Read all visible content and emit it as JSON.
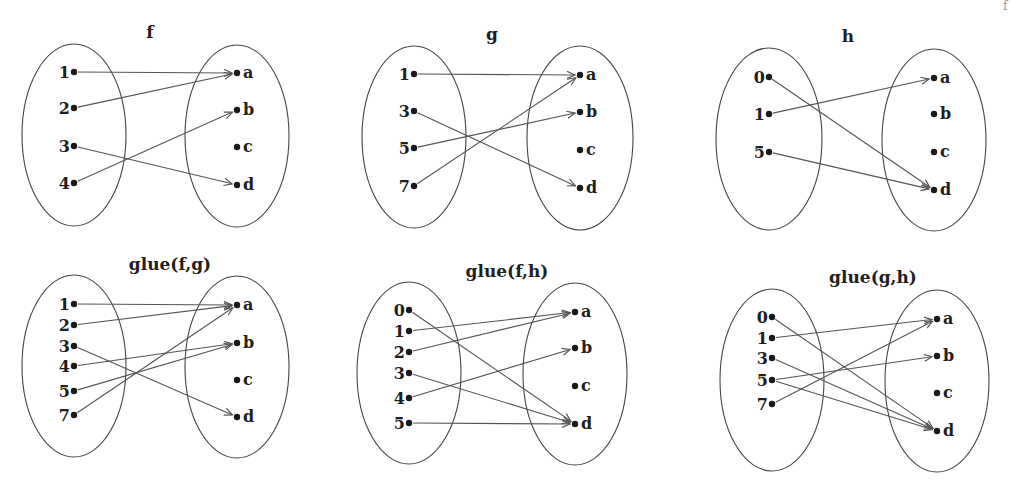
{
  "colors": {
    "ellipse": "#444444",
    "edge": "#555555",
    "dot": "#1a1a1a",
    "text": "#1e1e1e"
  },
  "corner_fragment": "f",
  "panels": [
    {
      "id": "f",
      "title": "f",
      "title_pos": [
        150,
        38
      ],
      "left": {
        "cx": 74,
        "cy": 135,
        "rx": 52,
        "ry": 91,
        "nodes": [
          {
            "label": "1",
            "y": 72
          },
          {
            "label": "2",
            "y": 108
          },
          {
            "label": "3",
            "y": 146
          },
          {
            "label": "4",
            "y": 183
          }
        ]
      },
      "right": {
        "cx": 237,
        "cy": 136,
        "rx": 52,
        "ry": 91,
        "nodes": [
          {
            "label": "a",
            "y": 73
          },
          {
            "label": "b",
            "y": 110
          },
          {
            "label": "c",
            "y": 147
          },
          {
            "label": "d",
            "y": 185
          }
        ]
      },
      "edges": [
        [
          "1",
          "a"
        ],
        [
          "2",
          "a"
        ],
        [
          "3",
          "d"
        ],
        [
          "4",
          "b"
        ]
      ]
    },
    {
      "id": "g",
      "title": "g",
      "title_pos": [
        492,
        40
      ],
      "left": {
        "cx": 414,
        "cy": 137,
        "rx": 52,
        "ry": 91,
        "nodes": [
          {
            "label": "1",
            "y": 74
          },
          {
            "label": "3",
            "y": 111
          },
          {
            "label": "5",
            "y": 148
          },
          {
            "label": "7",
            "y": 186
          }
        ]
      },
      "right": {
        "cx": 580,
        "cy": 138,
        "rx": 53,
        "ry": 92,
        "nodes": [
          {
            "label": "a",
            "y": 75
          },
          {
            "label": "b",
            "y": 112
          },
          {
            "label": "c",
            "y": 150
          },
          {
            "label": "d",
            "y": 188
          }
        ]
      },
      "edges": [
        [
          "1",
          "a"
        ],
        [
          "3",
          "d"
        ],
        [
          "5",
          "b"
        ],
        [
          "7",
          "a"
        ]
      ]
    },
    {
      "id": "h",
      "title": "h",
      "title_pos": [
        848,
        42
      ],
      "left": {
        "cx": 769,
        "cy": 139,
        "rx": 53,
        "ry": 91,
        "nodes": [
          {
            "label": "0",
            "y": 77
          },
          {
            "label": "1",
            "y": 114
          },
          {
            "label": "5",
            "y": 152
          }
        ]
      },
      "right": {
        "cx": 934,
        "cy": 140,
        "rx": 52,
        "ry": 91,
        "nodes": [
          {
            "label": "a",
            "y": 78
          },
          {
            "label": "b",
            "y": 114
          },
          {
            "label": "c",
            "y": 152
          },
          {
            "label": "d",
            "y": 190
          }
        ]
      },
      "edges": [
        [
          "0",
          "d"
        ],
        [
          "1",
          "a"
        ],
        [
          "5",
          "d"
        ]
      ]
    },
    {
      "id": "glue-f-g",
      "title": "glue(f,g)",
      "title_pos": [
        170,
        270
      ],
      "left": {
        "cx": 74,
        "cy": 366,
        "rx": 52,
        "ry": 91,
        "nodes": [
          {
            "label": "1",
            "y": 304
          },
          {
            "label": "2",
            "y": 325
          },
          {
            "label": "3",
            "y": 346
          },
          {
            "label": "4",
            "y": 366
          },
          {
            "label": "5",
            "y": 391
          },
          {
            "label": "7",
            "y": 415
          }
        ]
      },
      "right": {
        "cx": 237,
        "cy": 367,
        "rx": 52,
        "ry": 91,
        "nodes": [
          {
            "label": "a",
            "y": 305
          },
          {
            "label": "b",
            "y": 343
          },
          {
            "label": "c",
            "y": 380
          },
          {
            "label": "d",
            "y": 417
          }
        ]
      },
      "edges": [
        [
          "1",
          "a"
        ],
        [
          "2",
          "a"
        ],
        [
          "3",
          "d"
        ],
        [
          "4",
          "b"
        ],
        [
          "5",
          "b"
        ],
        [
          "7",
          "a"
        ]
      ]
    },
    {
      "id": "glue-f-h",
      "title": "glue(f,h)",
      "title_pos": [
        507,
        277
      ],
      "left": {
        "cx": 409,
        "cy": 373,
        "rx": 52,
        "ry": 91,
        "nodes": [
          {
            "label": "0",
            "y": 310
          },
          {
            "label": "1",
            "y": 331
          },
          {
            "label": "2",
            "y": 352
          },
          {
            "label": "3",
            "y": 373
          },
          {
            "label": "4",
            "y": 398
          },
          {
            "label": "5",
            "y": 423
          }
        ]
      },
      "right": {
        "cx": 575,
        "cy": 374,
        "rx": 52,
        "ry": 91,
        "nodes": [
          {
            "label": "a",
            "y": 312
          },
          {
            "label": "b",
            "y": 348
          },
          {
            "label": "c",
            "y": 386
          },
          {
            "label": "d",
            "y": 424
          }
        ]
      },
      "edges": [
        [
          "0",
          "d"
        ],
        [
          "1",
          "a"
        ],
        [
          "2",
          "a"
        ],
        [
          "3",
          "d"
        ],
        [
          "4",
          "b"
        ],
        [
          "5",
          "d"
        ]
      ]
    },
    {
      "id": "glue-g-h",
      "title": "glue(g,h)",
      "title_pos": [
        873,
        283
      ],
      "left": {
        "cx": 772,
        "cy": 380,
        "rx": 52,
        "ry": 91,
        "nodes": [
          {
            "label": "0",
            "y": 317
          },
          {
            "label": "1",
            "y": 338
          },
          {
            "label": "3",
            "y": 358
          },
          {
            "label": "5",
            "y": 380
          },
          {
            "label": "7",
            "y": 404
          }
        ]
      },
      "right": {
        "cx": 937,
        "cy": 381,
        "rx": 52,
        "ry": 91,
        "nodes": [
          {
            "label": "a",
            "y": 319
          },
          {
            "label": "b",
            "y": 356
          },
          {
            "label": "c",
            "y": 393
          },
          {
            "label": "d",
            "y": 431
          }
        ]
      },
      "edges": [
        [
          "0",
          "d"
        ],
        [
          "1",
          "a"
        ],
        [
          "3",
          "d"
        ],
        [
          "5",
          "b"
        ],
        [
          "5",
          "d"
        ],
        [
          "7",
          "a"
        ]
      ]
    }
  ]
}
